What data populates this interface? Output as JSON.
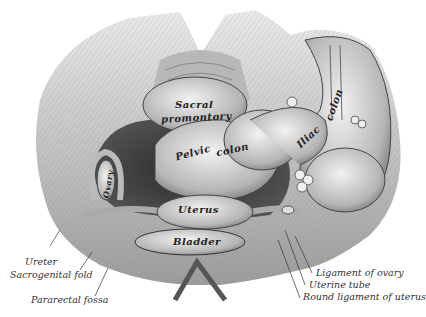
{
  "figure": {
    "style": "engraving, grayscale",
    "colors": {
      "background": "#ffffff",
      "ink": "#222222",
      "tissue_light": "#d8d8d8",
      "tissue_mid": "#9a9a9a",
      "tissue_dark": "#3a3a3a"
    }
  },
  "labels": {
    "internal": {
      "sacral": "Sacral",
      "promontory": "promontory",
      "pelvic": "Pelvic",
      "colon_pelvic": "colon",
      "iliac": "Iliac",
      "colon_iliac": "colon",
      "ovary": "Ovary",
      "uterus": "Uterus",
      "bladder": "Bladder"
    },
    "left_callouts": [
      {
        "text": "Ureter"
      },
      {
        "text": "Sacrogenital fold"
      },
      {
        "text": "Pararectal fossa"
      }
    ],
    "right_callouts": [
      {
        "text": "Ligament of ovary"
      },
      {
        "text": "Uterine tube"
      },
      {
        "text": "Round ligament of uterus"
      }
    ]
  }
}
